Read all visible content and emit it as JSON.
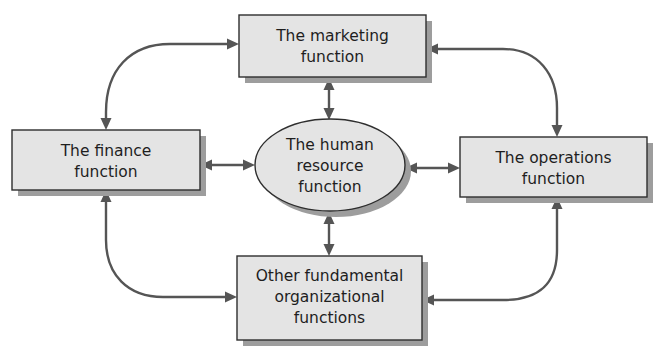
{
  "diagram": {
    "type": "relationship-hub",
    "center": {
      "id": "hr",
      "shape": "ellipse",
      "lines": [
        "The human",
        "resource",
        "function"
      ]
    },
    "nodes": [
      {
        "id": "marketing",
        "shape": "rectangle",
        "position": "top",
        "lines": [
          "The marketing",
          "function"
        ]
      },
      {
        "id": "finance",
        "shape": "rectangle",
        "position": "left",
        "lines": [
          "The finance",
          "function"
        ]
      },
      {
        "id": "operations",
        "shape": "rectangle",
        "position": "right",
        "lines": [
          "The operations",
          "function"
        ]
      },
      {
        "id": "other",
        "shape": "rectangle",
        "position": "bottom",
        "lines": [
          "Other fundamental",
          "organizational",
          "functions"
        ]
      }
    ],
    "edges": [
      {
        "from": "hr",
        "to": "marketing",
        "direction": "bidirectional",
        "style": "straight"
      },
      {
        "from": "hr",
        "to": "finance",
        "direction": "bidirectional",
        "style": "straight"
      },
      {
        "from": "hr",
        "to": "operations",
        "direction": "bidirectional",
        "style": "straight"
      },
      {
        "from": "hr",
        "to": "other",
        "direction": "bidirectional",
        "style": "straight"
      },
      {
        "from": "finance",
        "to": "marketing",
        "direction": "bidirectional",
        "style": "curved"
      },
      {
        "from": "marketing",
        "to": "operations",
        "direction": "bidirectional",
        "style": "curved"
      },
      {
        "from": "operations",
        "to": "other",
        "direction": "bidirectional",
        "style": "curved"
      },
      {
        "from": "other",
        "to": "finance",
        "direction": "bidirectional",
        "style": "curved"
      }
    ],
    "colors": {
      "box_fill": "#e4e4e4",
      "box_stroke": "#2e2e2e",
      "shadow": "#9d9d9d",
      "arrow": "#555555",
      "text": "#1e1e1e",
      "background": "#ffffff"
    }
  }
}
